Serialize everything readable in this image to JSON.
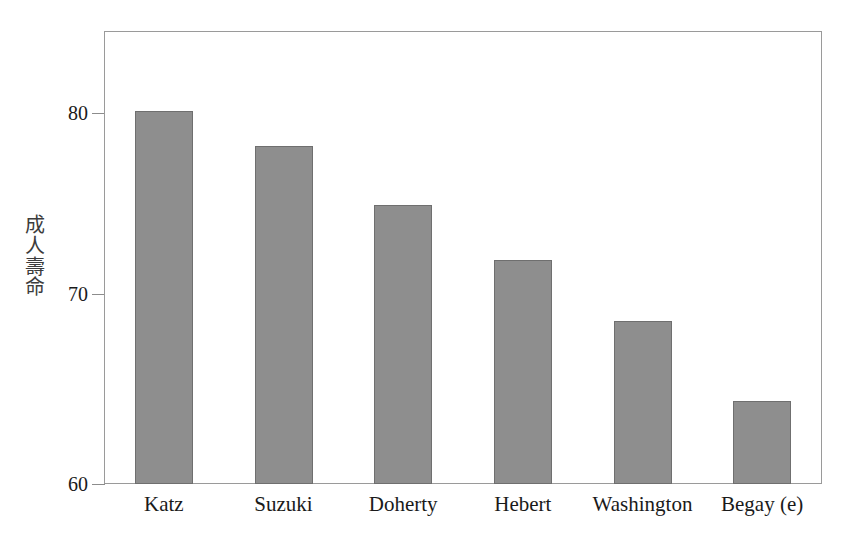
{
  "chart_data": {
    "type": "bar",
    "title": "",
    "subtitle": "",
    "xlabel": "",
    "ylabel": "成人壽命",
    "ylabel_chars": [
      "成",
      "人",
      "壽",
      "命"
    ],
    "categories": [
      "Katz",
      "Suzuki",
      "Doherty",
      "Hebert",
      "Washington",
      "Begay (e)"
    ],
    "values": [
      80.2,
      78.3,
      75.1,
      72.1,
      68.8,
      64.5
    ],
    "ylim": [
      60,
      84.5
    ],
    "yticks": [
      60,
      70,
      80
    ],
    "ytick_labels": [
      "60",
      "70",
      "80"
    ],
    "grid": false,
    "legend": false,
    "legend_position": "none",
    "bar_fill_color": "#8e8e8e",
    "bar_edge_color": "#6f6f6f",
    "frame_color": "#9a9a9a",
    "background_color": "#ffffff",
    "text_color": "#1a1a1a"
  }
}
